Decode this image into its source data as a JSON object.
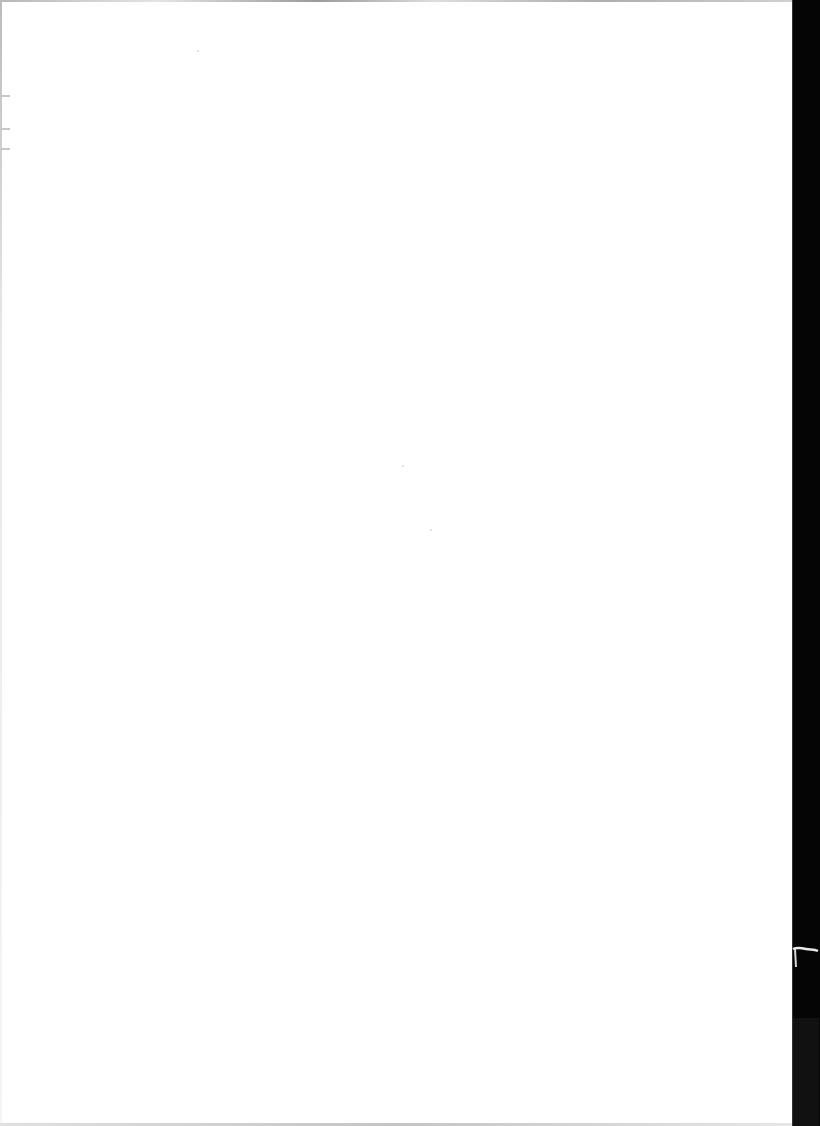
{
  "page": {
    "type": "blank scanned page",
    "background_color": "#ffffff",
    "edge_strip_color": "#050505"
  }
}
